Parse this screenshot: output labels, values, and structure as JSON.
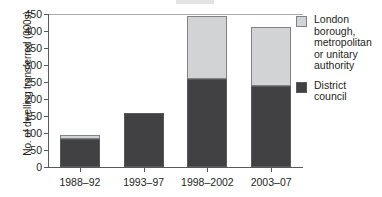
{
  "chart_data": {
    "type": "bar",
    "subtype": "stacked-vertical",
    "title": "",
    "xlabel": "",
    "ylabel": "No. of dwelling transferred (000s)",
    "categories": [
      "1988–92",
      "1993–97",
      "1998–2002",
      "2003–07"
    ],
    "series": [
      {
        "name": "District council",
        "color": "#414042",
        "values": [
          82,
          158,
          258,
          237
        ]
      },
      {
        "name": "London borough, metropolitan or unitary authority",
        "color": "#d1d3d4",
        "values": [
          11,
          0,
          187,
          175
        ]
      }
    ],
    "totals": [
      93,
      158,
      445,
      412
    ],
    "ylim": [
      0,
      450
    ],
    "ytick_step": 50,
    "ytick_labels": [
      "450",
      "400",
      "350",
      "300",
      "250",
      "200",
      "150",
      "100",
      "50",
      "0"
    ],
    "grid": false,
    "legend_position": "right"
  },
  "axis": {
    "y_title": "No. of dwelling transferred (000s)",
    "y_ticks": [
      {
        "label": "450",
        "value": 450
      },
      {
        "label": "400",
        "value": 400
      },
      {
        "label": "350",
        "value": 350
      },
      {
        "label": "300",
        "value": 300
      },
      {
        "label": "250",
        "value": 250
      },
      {
        "label": "200",
        "value": 200
      },
      {
        "label": "150",
        "value": 150
      },
      {
        "label": "100",
        "value": 100
      },
      {
        "label": "50",
        "value": 50
      },
      {
        "label": "0",
        "value": 0
      }
    ],
    "x_ticks": [
      {
        "label": "1988–92"
      },
      {
        "label": "1993–97"
      },
      {
        "label": "1998–2002"
      },
      {
        "label": "2003–07"
      }
    ]
  },
  "legend": {
    "items": [
      {
        "label": "London\nborough,\nmetropolitan\nor unitary\nauthority",
        "color": "#d1d3d4",
        "swatch": "light-gray-swatch"
      },
      {
        "label": "District\ncouncil",
        "color": "#414042",
        "swatch": "dark-gray-swatch"
      }
    ]
  },
  "colors": {
    "district_council": "#414042",
    "london_borough": "#d1d3d4",
    "axis": "#58595b",
    "background": "#ffffff"
  }
}
